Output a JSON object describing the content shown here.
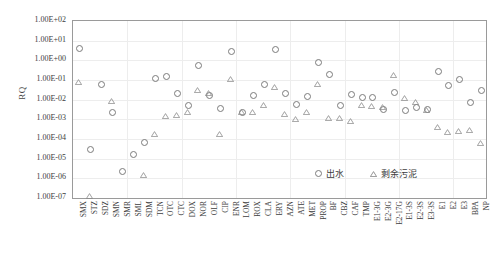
{
  "chart_data": {
    "type": "scatter",
    "title": "",
    "xlabel": "",
    "ylabel": "RQ",
    "yscale": "log",
    "ylim": [
      1e-07,
      100.0
    ],
    "ytick_labels": [
      "1.00E+02",
      "1.00E+01",
      "1.00E+00",
      "1.00E-01",
      "1.00E-02",
      "1.00E-03",
      "1.00E-04",
      "1.00E-05",
      "1.00E-06",
      "1.00E-07"
    ],
    "grid": true,
    "legend_position": "inside-bottom-right",
    "categories": [
      "SMX",
      "STZ",
      "SDZ",
      "SMN",
      "SMR",
      "SML",
      "SDM",
      "TCN",
      "OTC",
      "CTC",
      "DOX",
      "NOR",
      "OLF",
      "CIP",
      "ENR",
      "LOM",
      "ROX",
      "CLA",
      "ERY",
      "AZN",
      "ATE",
      "MET",
      "PROP",
      "BF",
      "CBZ",
      "CAF",
      "TMP",
      "E1-3G",
      "E2-3G",
      "E2-17G",
      "E1-3S",
      "E2-3S",
      "E3-3S",
      "E1",
      "E2",
      "E3",
      "BPA",
      "NP"
    ],
    "series": [
      {
        "name": "出水",
        "marker": "circle",
        "values": [
          4.6,
          3.2e-05,
          0.068,
          0.0026,
          2.4e-06,
          1.9e-05,
          7.5e-05,
          0.13,
          0.16,
          0.023,
          0.0055,
          0.59,
          0.019,
          0.0039,
          3.0,
          0.0024,
          0.018,
          0.065,
          4.0,
          0.023,
          0.0062,
          0.016,
          0.9,
          0.22,
          0.0055,
          0.02,
          0.014,
          0.015,
          0.0035,
          0.026,
          0.0032,
          0.0047,
          0.0037,
          0.29,
          0.06,
          0.12,
          0.008,
          0.033
        ]
      },
      {
        "name": "剩余污泥",
        "marker": "triangle",
        "values": [
          0.08,
          1.2e-07,
          null,
          0.0082,
          null,
          null,
          1.5e-06,
          0.00017,
          0.0015,
          0.0016,
          0.0024,
          0.032,
          0.022,
          0.00019,
          0.11,
          0.0023,
          0.0025,
          0.0055,
          0.042,
          0.0018,
          0.0011,
          0.0023,
          0.061,
          0.0012,
          0.0012,
          0.00085,
          0.0052,
          0.005,
          0.004,
          0.18,
          0.012,
          0.0073,
          0.0031,
          0.0004,
          0.00024,
          0.00027,
          0.00028,
          6e-05
        ]
      }
    ]
  },
  "legend": {
    "items": [
      {
        "label": "出水",
        "marker": "circle"
      },
      {
        "label": "剩余污泥",
        "marker": "triangle"
      }
    ]
  }
}
